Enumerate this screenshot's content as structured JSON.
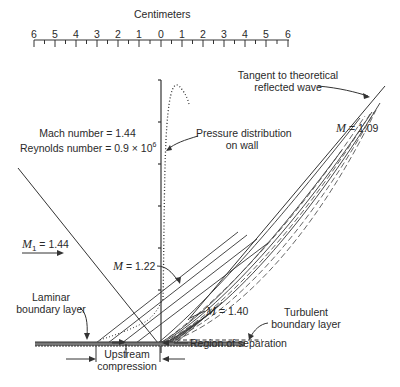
{
  "figure": {
    "scale": {
      "title": "Centimeters",
      "ticks": [
        "6",
        "5",
        "4",
        "3",
        "2",
        "1",
        "0",
        "1",
        "2",
        "3",
        "4",
        "5",
        "6"
      ]
    },
    "labels": {
      "tangent_line1": "Tangent to theoretical",
      "tangent_line2": "reflected wave",
      "m_109_var": "M",
      "m_109_val": " = 1.09",
      "mach_line": "Mach number = 1.44",
      "reynolds_line": "Reynolds number = 0.9 × 10",
      "reynolds_exp": "6",
      "pressure_line1": "Pressure distribution",
      "pressure_line2": "on wall",
      "m1_var": "M",
      "m1_sub": "1",
      "m1_val": " = 1.44",
      "m_122_var": "M",
      "m_122_val": " = 1.22",
      "m_140_var": "M",
      "m_140_val": " = 1.40",
      "laminar_line1": "Laminar",
      "laminar_line2": "boundary layer",
      "turbulent_line1": "Turbulent",
      "turbulent_line2": "boundary layer",
      "upstream_line1": "Upstream",
      "upstream_line2": "compression",
      "separation": "Region of separation"
    },
    "parameters": {
      "mach_number": 1.44,
      "reynolds_number": "0.9 × 10^6",
      "incident_mach": 1.44,
      "local_mach_values": [
        1.09,
        1.22,
        1.4
      ]
    },
    "colors": {
      "ink": "#2a2a2a",
      "background": "#ffffff"
    }
  }
}
